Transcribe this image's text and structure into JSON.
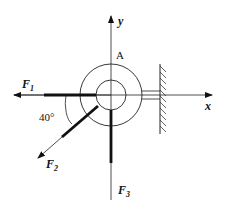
{
  "diagram": {
    "type": "force-diagram",
    "point_label": "A",
    "axes": {
      "x_label": "x",
      "y_label": "y"
    },
    "forces": [
      {
        "name": "F",
        "subscript": "1",
        "direction": "left"
      },
      {
        "name": "F",
        "subscript": "2",
        "direction": "down-left"
      },
      {
        "name": "F",
        "subscript": "3",
        "direction": "down"
      }
    ],
    "angle_label": "40°",
    "support": "fixed wall (hatched)"
  }
}
